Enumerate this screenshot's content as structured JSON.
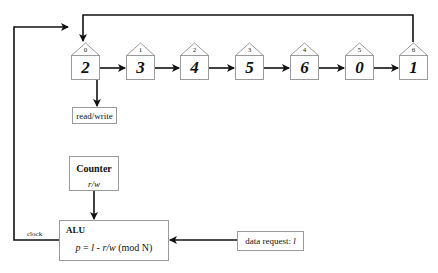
{
  "buffer": {
    "cells": [
      {
        "index": "0",
        "value": "2"
      },
      {
        "index": "1",
        "value": "3"
      },
      {
        "index": "2",
        "value": "4"
      },
      {
        "index": "3",
        "value": "5"
      },
      {
        "index": "4",
        "value": "6"
      },
      {
        "index": "5",
        "value": "0"
      },
      {
        "index": "6",
        "value": "1"
      }
    ]
  },
  "read_write": {
    "label": "read/write"
  },
  "counter": {
    "title": "Counter",
    "value": "r/w"
  },
  "alu": {
    "title": "ALU",
    "formula_p": "p",
    "formula_eq": " = ",
    "formula_l": "l",
    "formula_minus": " - ",
    "formula_rw": "r/w",
    "formula_mod": " (mod N)"
  },
  "data_request": {
    "label": "data request: ",
    "var": "l"
  },
  "clock": {
    "label": "clock"
  },
  "colors": {
    "line": "#111111",
    "border": "#9a9a9a",
    "background": "#ffffff"
  }
}
